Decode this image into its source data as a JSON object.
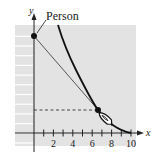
{
  "diagram": {
    "type": "tractrix-pursuit-curve",
    "annotation": "Person",
    "axes": {
      "x_label": "x",
      "y_label": "y",
      "x_ticks": [
        2,
        4,
        6,
        8,
        10
      ],
      "x_range": [
        0,
        10
      ],
      "y_range": [
        0,
        11
      ]
    },
    "points": {
      "person": {
        "x": 0,
        "y": 10
      },
      "tangency": {
        "x": 6.6,
        "y": 2.4
      }
    },
    "colors": {
      "background": "#e3e3e3",
      "curve": "#111111",
      "line": "#444444"
    }
  }
}
